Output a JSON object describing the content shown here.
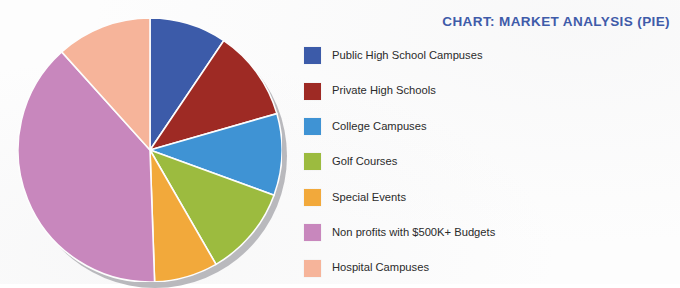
{
  "title": "CHART: MARKET ANALYSIS (PIE)",
  "title_color": "#3f5ba9",
  "legend": {
    "items": [
      {
        "label": "Public High School Campuses",
        "color": "#3c5ba9"
      },
      {
        "label": "Private High Schools",
        "color": "#9e2a24"
      },
      {
        "label": "College Campuses",
        "color": "#3f93d4"
      },
      {
        "label": "Golf Courses",
        "color": "#9cbb3f"
      },
      {
        "label": "Special Events",
        "color": "#f2a93b"
      },
      {
        "label": "Non profits with $500K+ Budgets",
        "color": "#c887bd"
      },
      {
        "label": "Hospital Campuses",
        "color": "#f6b49a"
      }
    ]
  },
  "chart_data": {
    "type": "pie",
    "title": "CHART: MARKET ANALYSIS (PIE)",
    "xlabel": "",
    "ylabel": "",
    "grid": false,
    "legend_position": "right",
    "start_angle_deg": 0,
    "direction": "clockwise",
    "categories": [
      "Public High School Campuses",
      "Private High Schools",
      "College Campuses",
      "Golf Courses",
      "Special Events",
      "Non profits with $500K+ Budgets",
      "Hospital Campuses"
    ],
    "values": [
      9.5,
      11,
      10,
      11,
      8,
      39,
      11.5
    ],
    "unit": "percent",
    "slice_angles_deg": [
      34,
      40,
      36,
      40,
      28,
      140,
      42
    ],
    "colors": [
      "#3c5ba9",
      "#9e2a24",
      "#3f93d4",
      "#9cbb3f",
      "#f2a93b",
      "#c887bd",
      "#f6b49a"
    ]
  }
}
